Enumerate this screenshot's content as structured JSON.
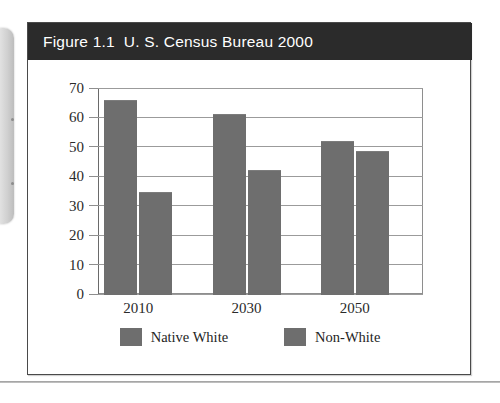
{
  "page": {
    "background_color": "#ffffff",
    "artifacts": {
      "binding_edge": "scanned-book-spine-edge",
      "bottom_rule": "page-edge-line"
    }
  },
  "figure": {
    "title": "Figure 1.1  U. S. Census Bureau 2000",
    "title_bar_color": "#2b2b2b",
    "title_text_color": "#ffffff",
    "border_color": "#4a4a4a"
  },
  "chart_data": {
    "type": "bar",
    "title": "Figure 1.1  U. S. Census Bureau 2000",
    "xlabel": "",
    "ylabel": "",
    "categories": [
      "2010",
      "2030",
      "2050"
    ],
    "series": [
      {
        "name": "Native White",
        "values": [
          66,
          61,
          52
        ],
        "color": "#6e6e6e"
      },
      {
        "name": "Non-White",
        "values": [
          34.5,
          42,
          48.5
        ],
        "color": "#6e6e6e"
      }
    ],
    "ylim": [
      0,
      70
    ],
    "yticks": [
      0,
      10,
      20,
      30,
      40,
      50,
      60,
      70
    ],
    "ytick_labels": [
      "0",
      "10",
      "20",
      "30",
      "40",
      "50",
      "60",
      "70"
    ],
    "grid": true,
    "grid_axis": "y",
    "legend_position": "bottom",
    "legend": [
      "Native White",
      "Non-White"
    ]
  }
}
